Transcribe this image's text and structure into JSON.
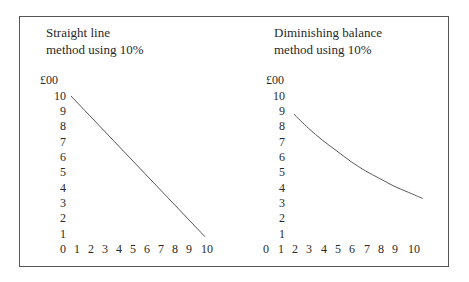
{
  "chart_data": [
    {
      "type": "line",
      "title": "Straight line method using 10%",
      "title_lines": [
        "Straight line",
        "method using 10%"
      ],
      "ylabel": "£00",
      "xlabel": "",
      "y_ticks": [
        "10",
        "9",
        "8",
        "7",
        "6",
        "5",
        "4",
        "3",
        "2",
        "1",
        "0"
      ],
      "x_ticks": [
        "0",
        "1",
        "2",
        "3",
        "4",
        "5",
        "6",
        "7",
        "8",
        "9",
        "10"
      ],
      "ylim": [
        0,
        10
      ],
      "xlim": [
        0,
        10
      ],
      "grid": false,
      "series": [
        {
          "name": "Straight line",
          "x": [
            0,
            10
          ],
          "y": [
            10,
            1
          ]
        }
      ]
    },
    {
      "type": "line",
      "title": "Diminishing balance method using 10%",
      "title_lines": [
        "Diminishing balance",
        "method using 10%"
      ],
      "ylabel": "£00",
      "xlabel": "",
      "y_ticks": [
        "10",
        "9",
        "8",
        "7",
        "6",
        "5",
        "4",
        "3",
        "2",
        "1",
        ""
      ],
      "x_ticks": [
        "0",
        "1",
        "2",
        "3",
        "4",
        "5",
        "6",
        "7",
        "8",
        "9",
        "10"
      ],
      "ylim": [
        0,
        10
      ],
      "xlim": [
        0,
        10
      ],
      "grid": false,
      "series": [
        {
          "name": "Diminishing balance",
          "x": [
            1,
            2,
            3,
            4,
            5,
            6,
            7,
            8,
            9,
            10
          ],
          "y": [
            9.0,
            8.1,
            7.3,
            6.6,
            5.9,
            5.3,
            4.8,
            4.3,
            3.9,
            3.5
          ]
        }
      ]
    }
  ]
}
